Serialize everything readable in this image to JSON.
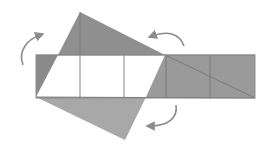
{
  "diagram": {
    "colors": {
      "dark_fill": "#8a8a8a",
      "mid_fill": "#a6a6a6",
      "light_fill": "#b8b8b8",
      "white_fill": "#ffffff",
      "line": "#6e6e6e",
      "arrow": "#8c8c8c"
    },
    "arrows": [
      {
        "name": "rotate-arrow-top-left"
      },
      {
        "name": "rotate-arrow-top-right"
      },
      {
        "name": "rotate-arrow-bottom-right"
      }
    ]
  }
}
